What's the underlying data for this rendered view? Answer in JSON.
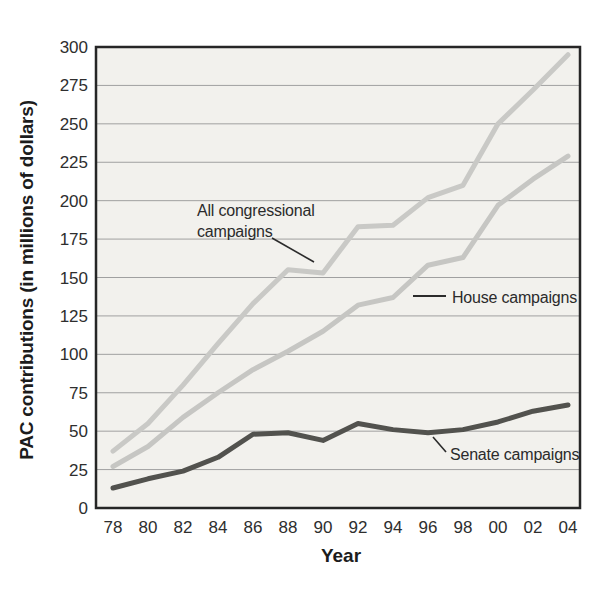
{
  "figure": {
    "y_axis_title": "PAC contributions (in millions of dollars)",
    "x_axis_title": "Year",
    "annotations": {
      "all": "All congressional\ncampaigns",
      "house": "House campaigns",
      "senate": "Senate campaigns"
    },
    "colors": {
      "axis": "#262626",
      "grid": "#a0a0a0",
      "plot_bg": "#f2f1ed",
      "text": "#2b2b2b",
      "light_line": "#c9c9c6",
      "dark_line": "#52524e"
    }
  },
  "chart_data": {
    "type": "line",
    "title": "",
    "xlabel": "Year",
    "ylabel": "PAC contributions (in millions of dollars)",
    "categories": [
      "78",
      "80",
      "82",
      "84",
      "86",
      "88",
      "90",
      "92",
      "94",
      "96",
      "98",
      "00",
      "02",
      "04"
    ],
    "series": [
      {
        "name": "All congressional campaigns",
        "color": "#c9c9c6",
        "values": [
          37,
          55,
          80,
          107,
          133,
          155,
          153,
          183,
          184,
          202,
          210,
          250,
          272,
          295
        ]
      },
      {
        "name": "House campaigns",
        "color": "#c6c6c3",
        "values": [
          27,
          40,
          59,
          75,
          90,
          102,
          115,
          132,
          137,
          158,
          163,
          197,
          214,
          229
        ]
      },
      {
        "name": "Senate campaigns",
        "color": "#52524e",
        "values": [
          13,
          19,
          24,
          33,
          48,
          49,
          44,
          55,
          51,
          49,
          51,
          56,
          63,
          67
        ]
      }
    ],
    "ylim": [
      0,
      300
    ],
    "yticks": [
      0,
      25,
      50,
      75,
      100,
      125,
      150,
      175,
      200,
      225,
      250,
      275,
      300
    ],
    "grid": true,
    "legend_position": "inline-annotations"
  }
}
